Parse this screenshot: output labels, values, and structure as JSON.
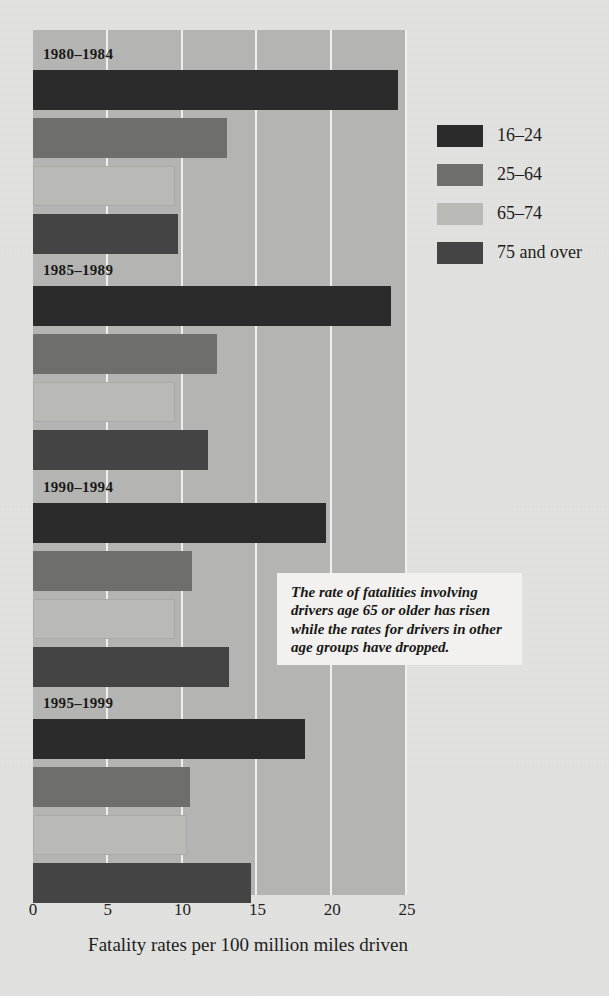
{
  "chart_data": {
    "type": "bar",
    "orientation": "horizontal",
    "title": "",
    "xlabel": "Fatality rates per 100 million miles driven",
    "ylabel": "",
    "xlim": [
      0,
      25
    ],
    "xticks": [
      0,
      5,
      10,
      15,
      20,
      25
    ],
    "xticklabels": [
      "0",
      "5",
      "10",
      "15",
      "20",
      "25"
    ],
    "grid": true,
    "grid_axis": "x",
    "legend_position": "right",
    "categories": [
      "1980–1984",
      "1985–1989",
      "1990–1994",
      "1995–1999"
    ],
    "series": [
      {
        "name": "16–24",
        "color": "#2b2b2b",
        "values": [
          24.4,
          23.9,
          19.6,
          18.2
        ]
      },
      {
        "name": "25–64",
        "color": "#6e6e6c",
        "values": [
          13.0,
          12.3,
          10.6,
          10.5
        ]
      },
      {
        "name": "65–74",
        "color": "#b9b9b6",
        "values": [
          9.5,
          9.5,
          9.5,
          10.3
        ]
      },
      {
        "name": "75 and over",
        "color": "#444444",
        "values": [
          9.7,
          11.7,
          13.1,
          14.6
        ]
      }
    ],
    "annotation": "The rate of fatalities involving drivers age 65 or older has risen while the rates for drivers in other age groups have dropped."
  },
  "legend": {
    "items": [
      {
        "label": "16–24"
      },
      {
        "label": "25–64"
      },
      {
        "label": "65–74"
      },
      {
        "label": "75 and over"
      }
    ]
  },
  "colors": {
    "page_background": "#e3e3e1",
    "plot_background": "#b4b4b2",
    "gridline": "#f0efed",
    "callout_background": "#f2f1ef",
    "text": "#1d1d1b"
  }
}
